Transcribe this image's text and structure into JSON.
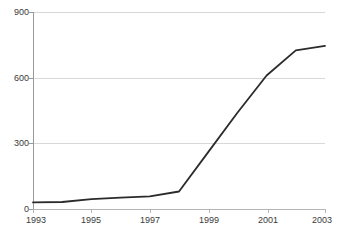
{
  "chart_data": {
    "type": "line",
    "title": "",
    "subtitle": "",
    "xlabel": "",
    "ylabel": "",
    "x": [
      1993,
      1994,
      1995,
      1996,
      1997,
      1998,
      1999,
      2000,
      2001,
      2002,
      2003
    ],
    "values": [
      30,
      32,
      45,
      52,
      58,
      80,
      260,
      440,
      610,
      725,
      745
    ],
    "series": [
      {
        "name": "series-1",
        "values": [
          30,
          32,
          45,
          52,
          58,
          80,
          260,
          440,
          610,
          725,
          745
        ]
      }
    ],
    "xlim": [
      1993,
      2003
    ],
    "ylim": [
      0,
      900
    ],
    "y_ticks": [
      0,
      300,
      600,
      900
    ],
    "y_tick_labels": [
      "0",
      "300",
      "600",
      "900"
    ],
    "x_ticks": [
      1993,
      1995,
      1997,
      1999,
      2001,
      2003
    ],
    "x_tick_labels": [
      "1993",
      "1995",
      "1997",
      "1999",
      "2001",
      "2003"
    ],
    "grid": true,
    "legend": false,
    "legend_position": "none",
    "annotations": [],
    "colors": {
      "line": "#2b2b2b",
      "grid": "#d8d8d8",
      "axis": "#9a9a9a",
      "text": "#3a3a3a",
      "background": "#ffffff"
    }
  },
  "axes": {
    "y_labels": [
      "900",
      "600",
      "300",
      "0"
    ],
    "x_labels": [
      "1993",
      "1995",
      "1997",
      "1999",
      "2001",
      "2003"
    ]
  }
}
